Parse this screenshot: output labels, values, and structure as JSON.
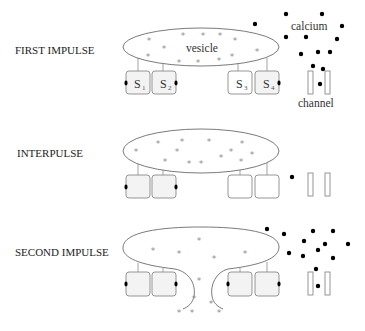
{
  "figure": {
    "type": "synaptic vesicle release schematic",
    "colors": {
      "background": "#ffffff",
      "outline": "#6b6b6b",
      "box_stroke": "#8a8a8a",
      "box_fill_light": "#f3f3f3",
      "box_fill_white": "#ffffff",
      "neurotransmitter": "#8c8c8c",
      "calcium": "#000000"
    }
  },
  "labels": {
    "vesicle": "vesicle",
    "calcium": "calcium",
    "channel": "channel",
    "star_glyph": "*",
    "s1": "S",
    "s1_sub": "1",
    "s2": "S",
    "s2_sub": "2",
    "s3": "S",
    "s3_sub": "3",
    "s4": "S",
    "s4_sub": "4"
  },
  "panels": [
    {
      "label": "FIRST IMPULSE",
      "vesicle_state": "intact",
      "sensors": [
        {
          "name": "S1",
          "fill": "#f3f3f3",
          "bound_calcium_left": true
        },
        {
          "name": "S2",
          "fill": "#f3f3f3",
          "bound_calcium_right": true
        },
        {
          "name": "S3",
          "fill": "#ffffff"
        },
        {
          "name": "S4",
          "fill": "#f3f3f3",
          "bound_calcium_right": true
        }
      ],
      "calcium_count": 14
    },
    {
      "label": "INTERPULSE",
      "vesicle_state": "intact",
      "sensors": [
        {
          "name": "S1",
          "fill": "#f3f3f3",
          "bound_calcium_left": true
        },
        {
          "name": "S2",
          "fill": "#f3f3f3",
          "bound_calcium_right": true
        },
        {
          "name": "S3",
          "fill": "#ffffff"
        },
        {
          "name": "S4",
          "fill": "#ffffff"
        }
      ],
      "calcium_count": 1
    },
    {
      "label": "SECOND IMPULSE",
      "vesicle_state": "fused, releasing",
      "sensors": [
        {
          "name": "S1",
          "fill": "#f3f3f3",
          "bound_calcium_left": true
        },
        {
          "name": "S2",
          "fill": "#f3f3f3",
          "bound_calcium_right": true
        },
        {
          "name": "S3",
          "fill": "#f3f3f3",
          "bound_calcium_left": true
        },
        {
          "name": "S4",
          "fill": "#f3f3f3",
          "bound_calcium_right": true
        }
      ],
      "calcium_count": 14
    }
  ]
}
